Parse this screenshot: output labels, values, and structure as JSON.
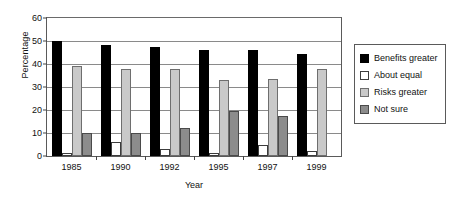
{
  "chart_data": {
    "type": "bar",
    "title": "",
    "subtitle": "",
    "xlabel": "Year",
    "ylabel": "Percentage",
    "categories": [
      "1985",
      "1990",
      "1992",
      "1995",
      "1997",
      "1999"
    ],
    "ylim": [
      0,
      60
    ],
    "yticks": [
      0,
      10,
      20,
      30,
      40,
      50,
      60
    ],
    "ytick_labels": [
      "0",
      "10",
      "20",
      "30",
      "40",
      "50",
      "60"
    ],
    "grid": true,
    "grid_axis": "y",
    "legend_position": "right",
    "series": [
      {
        "name": "Benefits greater",
        "color": "#000000",
        "values": [
          50,
          48.3,
          47.5,
          46,
          46,
          44.5
        ]
      },
      {
        "name": "About equal",
        "color": "#ffffff",
        "values": [
          1.5,
          6,
          3,
          1.5,
          5,
          2
        ]
      },
      {
        "name": "Risks greater",
        "color": "#c9c9c9",
        "values": [
          39,
          38,
          38,
          33,
          33.5,
          38
        ]
      },
      {
        "name": "Not sure",
        "color": "#8c8c8c",
        "values": [
          9.8,
          9.8,
          12.3,
          19.5,
          17.5,
          0
        ]
      }
    ]
  },
  "legend": {
    "items": [
      {
        "label": "Benefits greater",
        "swatch": "benefits"
      },
      {
        "label": "About equal",
        "swatch": "equal"
      },
      {
        "label": "Risks greater",
        "swatch": "risks"
      },
      {
        "label": "Not sure",
        "swatch": "notsure"
      }
    ]
  }
}
